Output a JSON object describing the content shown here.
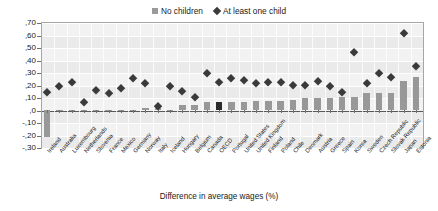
{
  "chart_data": {
    "type": "bar",
    "title": "",
    "xlabel": "Difference in average wages (%)",
    "ylabel": "",
    "ylim": [
      -0.3,
      0.7
    ],
    "ytick_labels": [
      ",70",
      ",60",
      ",50",
      ",40",
      ",30",
      ",20",
      ",10",
      ",0",
      "-,10",
      "-,20",
      "-,30"
    ],
    "ytick_values": [
      0.7,
      0.6,
      0.5,
      0.4,
      0.3,
      0.2,
      0.1,
      0.0,
      -0.1,
      -0.2,
      -0.3
    ],
    "grid": true,
    "legend_position": "top-center",
    "categories": [
      "Ireland",
      "Australia",
      "Luxembourg",
      "Netherlands",
      "Slovenia",
      "France",
      "Mexico",
      "Germany",
      "Norway",
      "Italy",
      "Iceland",
      "Hungary",
      "Belgium",
      "Canada",
      "OECD",
      "Portugal",
      "United States",
      "United Kingdom",
      "Finland",
      "Poland",
      "Chile",
      "Denmark",
      "Austria",
      "Greece",
      "Spain",
      "Korea",
      "Sweden",
      "Czech Republic",
      "Slovak Republic",
      "Japan",
      "Estonia"
    ],
    "highlight_category": "OECD",
    "series": [
      {
        "name": "No children",
        "marker": "bar",
        "color": "#989898",
        "highlight_color": "#2b2b2b",
        "values": [
          -0.22,
          -0.01,
          -0.01,
          -0.01,
          -0.01,
          -0.01,
          -0.01,
          -0.01,
          0.01,
          0.01,
          0.0,
          0.04,
          0.04,
          0.06,
          0.06,
          0.06,
          0.06,
          0.07,
          0.07,
          0.07,
          0.08,
          0.09,
          0.09,
          0.09,
          0.1,
          0.1,
          0.13,
          0.13,
          0.13,
          0.23,
          0.26
        ]
      },
      {
        "name": "At least one child",
        "marker": "diamond",
        "color": "#3a3a3a",
        "values": [
          0.14,
          0.19,
          0.22,
          0.06,
          0.16,
          0.13,
          0.17,
          0.25,
          0.21,
          0.03,
          0.19,
          0.15,
          0.1,
          0.29,
          0.22,
          0.25,
          0.24,
          0.21,
          0.22,
          0.22,
          0.2,
          0.2,
          0.23,
          0.19,
          0.14,
          0.46,
          0.21,
          0.29,
          0.26,
          0.61,
          0.35
        ]
      }
    ]
  },
  "legend": {
    "entries": [
      {
        "label": "No children",
        "icon": "square-marker"
      },
      {
        "label": "At least one child",
        "icon": "diamond-marker"
      }
    ]
  }
}
